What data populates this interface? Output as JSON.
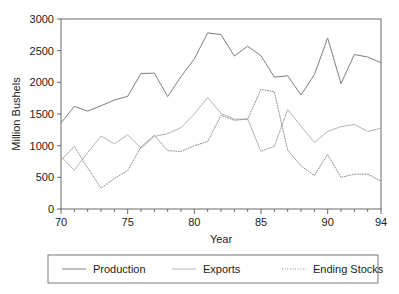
{
  "chart_data": {
    "type": "line",
    "title": "",
    "xlabel": "Year",
    "ylabel": "Million Bushels",
    "xlim": [
      70,
      94
    ],
    "ylim": [
      0,
      3000
    ],
    "yticks": [
      0,
      500,
      1000,
      1500,
      2000,
      2500,
      3000
    ],
    "xticks": [
      70,
      75,
      80,
      85,
      90,
      94
    ],
    "xtick_labels": [
      "70",
      "75",
      "80",
      "85",
      "90",
      "94"
    ],
    "ytick_labels": [
      "0",
      "500",
      "1000",
      "1500",
      "2000",
      "2500",
      "3000"
    ],
    "minor_xticks_every": 1,
    "grid": false,
    "legend_position": "bottom-outside",
    "x": [
      70,
      71,
      72,
      73,
      74,
      75,
      76,
      77,
      78,
      79,
      80,
      81,
      82,
      83,
      84,
      85,
      86,
      87,
      88,
      89,
      90,
      91,
      92,
      93,
      94
    ],
    "series": [
      {
        "name": "Production",
        "style": "solid",
        "color": "#777777",
        "values": [
          1360,
          1620,
          1545,
          1630,
          1720,
          1780,
          2140,
          2145,
          1775,
          2090,
          2370,
          2780,
          2755,
          2415,
          2570,
          2420,
          2080,
          2105,
          1800,
          2120,
          2700,
          1980,
          2440,
          2400,
          2310
        ]
      },
      {
        "name": "Exports",
        "style": "solid",
        "color": "#b0b0b0",
        "values": [
          830,
          610,
          890,
          1150,
          1030,
          1170,
          960,
          1145,
          1190,
          1285,
          1500,
          1760,
          1510,
          1420,
          1420,
          910,
          990,
          1570,
          1310,
          1050,
          1225,
          1300,
          1335,
          1225,
          1275
        ]
      },
      {
        "name": "Ending Stocks",
        "style": "dotted",
        "color": "#8a8a8a",
        "values": [
          770,
          990,
          650,
          330,
          480,
          610,
          980,
          1165,
          920,
          910,
          1000,
          1065,
          1480,
          1400,
          1420,
          1890,
          1850,
          930,
          680,
          530,
          860,
          500,
          550,
          550,
          440
        ]
      }
    ]
  },
  "legend": {
    "entries": [
      {
        "label": "Production"
      },
      {
        "label": "Exports"
      },
      {
        "label": "Ending Stocks"
      }
    ]
  },
  "axes": {
    "y_title": "Million Bushels",
    "x_title": "Year"
  }
}
